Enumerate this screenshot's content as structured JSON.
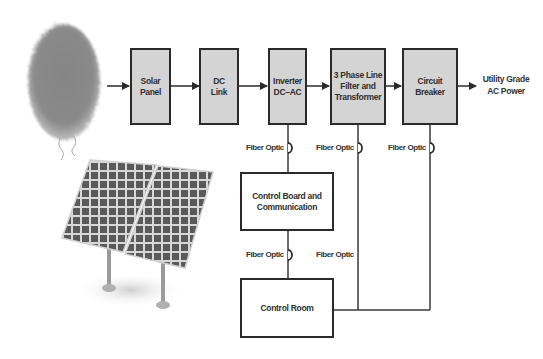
{
  "diagram": {
    "blocks": [
      {
        "id": "solar_panel",
        "label": "Solar\nPanel"
      },
      {
        "id": "dc_link",
        "label": "DC\nLink"
      },
      {
        "id": "inverter",
        "label": "Inverter\nDC–AC"
      },
      {
        "id": "filter_transformer",
        "label": "3 Phase Line\nFilter and\nTransformer"
      },
      {
        "id": "circuit_breaker",
        "label": "Circuit\nBreaker"
      },
      {
        "id": "control_board",
        "label": "Control Board and\nCommunication"
      },
      {
        "id": "control_room",
        "label": "Control Room"
      }
    ],
    "output_label": "Utility Grade\nAC Power",
    "fiber_labels": [
      "Fiber Optic",
      "Fiber Optic",
      "Fiber Optic",
      "Fiber Optic",
      "Fiber Optic"
    ],
    "illustrations": {
      "sun": "sun-illustration",
      "panel": "solar-panel-illustration"
    },
    "colors": {
      "block_fill": "#d4d4d4",
      "block_border": "#2a2a2a",
      "line": "#3a3a3a",
      "sun": "#7a7a7a"
    }
  }
}
